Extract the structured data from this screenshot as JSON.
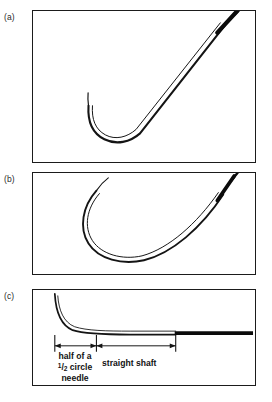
{
  "figure": {
    "background_color": "#ffffff",
    "ink_color": "#1b1b1b",
    "panels": [
      {
        "id": "a",
        "label": "(a)",
        "content": "J-shaped needle with short hooked tip and long straight diagonal shaft swaged to suture"
      },
      {
        "id": "b",
        "label": "(b)",
        "content": "Deeply curved half-circle hook needle swaged to suture"
      },
      {
        "id": "c",
        "label": "(c)",
        "content": "Needle profile with hook curve and long horizontal straight shaft, annotated with dimension arrows"
      }
    ]
  },
  "annotations": {
    "hook_label_line1": "half of a",
    "hook_label_fraction_numerator": "1",
    "hook_label_fraction_denominator": "2",
    "hook_label_line2_suffix": "circle",
    "hook_label_line3": "needle",
    "shaft_label": "straight shaft"
  }
}
